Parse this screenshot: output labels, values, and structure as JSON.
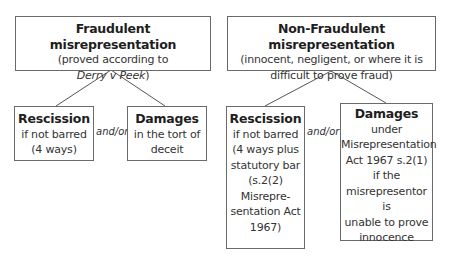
{
  "left": {
    "root": {
      "title": "Fraudulent misrepresentation",
      "line1": "(proved according to",
      "case_name": "Derry v Peek",
      "close_paren": ")"
    },
    "rescission": {
      "title": "Rescission",
      "lines": [
        "if not barred",
        "(4 ways)"
      ]
    },
    "connector": "and/or",
    "damages": {
      "title": "Damages",
      "lines": [
        "in the tort of",
        "deceit"
      ]
    }
  },
  "right": {
    "root": {
      "title": "Non-Fraudulent misrepresentation",
      "lines": [
        "(innocent, negligent, or where it is",
        "difficult to prove fraud)"
      ]
    },
    "rescission": {
      "title": "Rescission",
      "lines": [
        "if not barred",
        "(4 ways plus",
        "statutory bar",
        "(s.2(2)",
        "Misrepre-",
        "sentation Act",
        "1967)"
      ]
    },
    "connector": "and/or",
    "damages": {
      "title": "Damages",
      "lines": [
        "under",
        "Misrepresentation",
        "Act 1967 s.2(1)",
        "if the",
        "misrepresentor is",
        "unable to prove",
        "innocence"
      ]
    }
  }
}
